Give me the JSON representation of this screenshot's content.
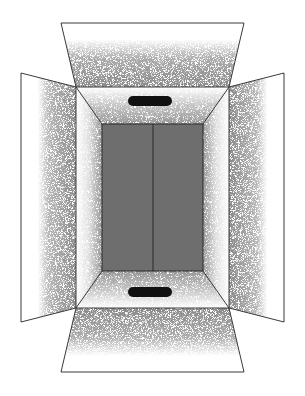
{
  "illustration": {
    "subject": "open cardboard box viewed from above",
    "colors": {
      "background": "#ffffff",
      "outline": "#3a3a3a",
      "interior_floor": "#6e6e6e",
      "stipple": "#555555",
      "handle": "#111111"
    },
    "parts": {
      "top_flap": "top-flap",
      "bottom_flap": "bottom-flap",
      "left_flap": "left-flap",
      "right_flap": "right-flap",
      "back_wall": "inner-floor",
      "top_handle": "hand-hole-top",
      "bottom_handle": "hand-hole-bottom",
      "center_seam": "center-seam"
    }
  }
}
